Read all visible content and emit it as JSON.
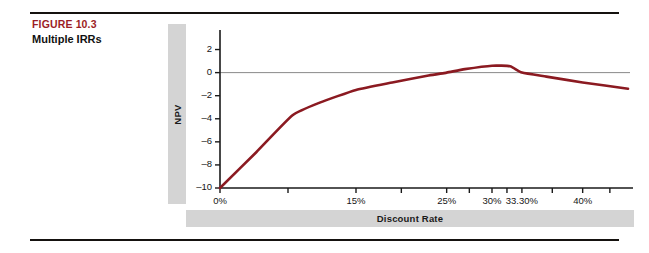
{
  "figure": {
    "number": "FIGURE 10.3",
    "title": "Multiple IRRs",
    "number_color": "#9c1d26"
  },
  "chart_data": {
    "type": "line",
    "title": "",
    "xlabel": "Discount Rate",
    "ylabel": "NPV",
    "xlim": [
      0,
      45
    ],
    "ylim": [
      -10,
      3
    ],
    "grid": false,
    "legend": null,
    "line_color": "#8b1a21",
    "zero_line_color": "#8a8a8a",
    "axis_color": "#1a1a1a",
    "x_tick_labels": [
      "0%",
      "15%",
      "25%",
      "30%",
      "33.30%",
      "40%"
    ],
    "x_tick_values": [
      0,
      15,
      25,
      30,
      33.3,
      40
    ],
    "y_tick_labels": [
      "2",
      "0",
      "-2",
      "-4",
      "-6",
      "-8",
      "-10"
    ],
    "y_tick_values": [
      2,
      0,
      -2,
      -4,
      -6,
      -8,
      -10
    ],
    "x": [
      0,
      4,
      8,
      11,
      15,
      19,
      23,
      25,
      27,
      30,
      32,
      33.3,
      36,
      40,
      45
    ],
    "values": [
      -10,
      -6.9,
      -3.7,
      -2.6,
      -1.5,
      -0.85,
      -0.25,
      0,
      0.3,
      0.6,
      0.55,
      0,
      -0.35,
      -0.85,
      -1.4
    ],
    "annotations": [
      {
        "label": "first IRR",
        "x": 25,
        "y": 0
      },
      {
        "label": "second IRR",
        "x": 33.3,
        "y": 0
      }
    ]
  }
}
